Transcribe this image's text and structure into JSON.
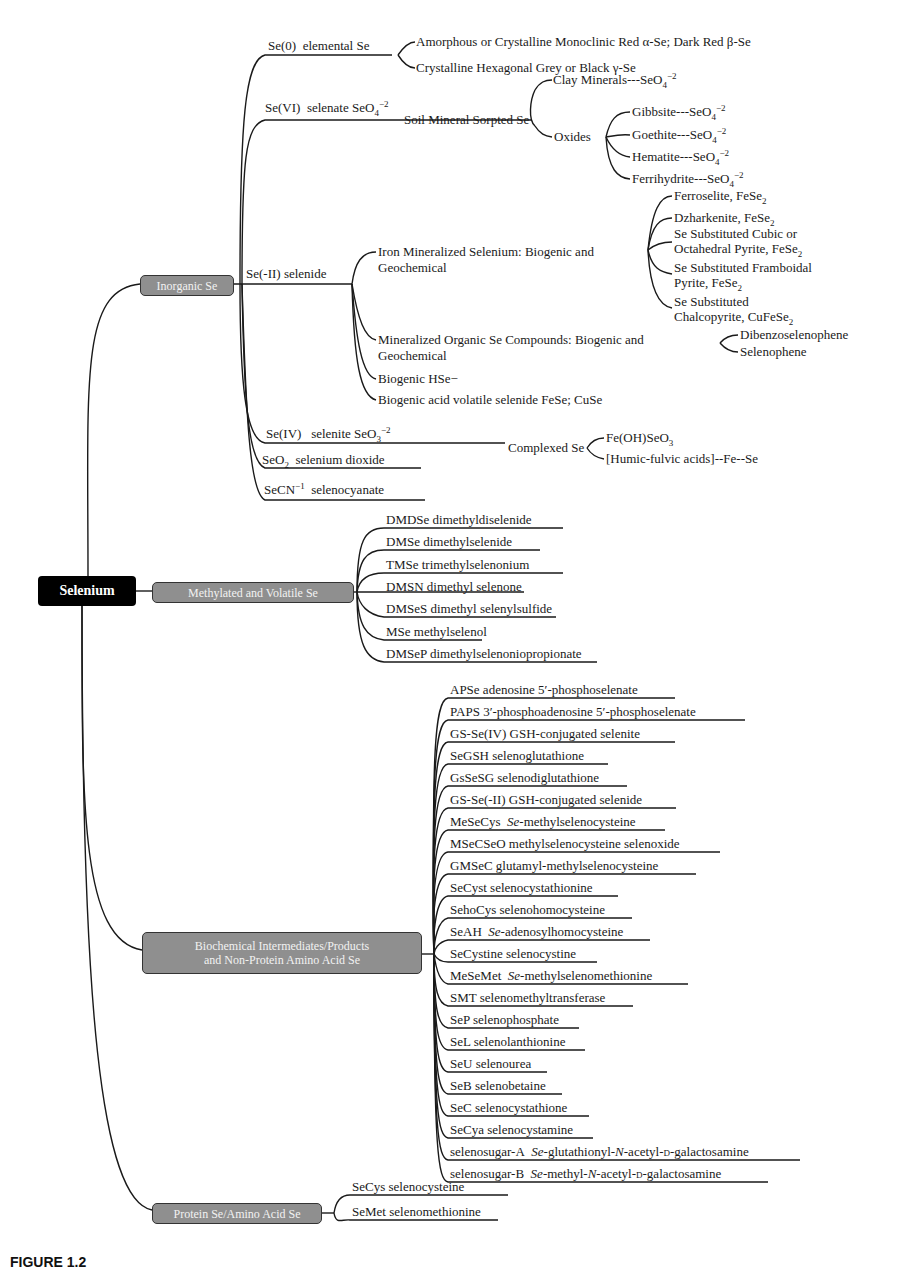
{
  "root": {
    "label": "Selenium"
  },
  "categories": {
    "inorganic": "Inorganic Se",
    "methylated": "Methylated and Volatile Se",
    "biochemical_line1": "Biochemical Intermediates/Products",
    "biochemical_line2": "and Non-Protein Amino Acid Se",
    "protein": "Protein Se/Amino Acid Se"
  },
  "inorganic": {
    "se0": {
      "label": "Se(0)  elemental Se",
      "children": [
        "Amorphous or Crystalline Monoclinic Red α-Se; Dark Red β-Se",
        "Crystalline Hexagonal Grey or Black γ-Se"
      ]
    },
    "se6": {
      "label": "Se(VI)  selenate SeO4−2",
      "sorbed": "Soil Mineral Sorpted Se",
      "clay": "Clay Minerals---SeO4−2",
      "oxides": "Oxides",
      "oxide_children": [
        "Gibbsite---SeO4−2",
        "Goethite---SeO4−2",
        "Hematite---SeO4−2",
        "Ferrihydrite---SeO4−2"
      ]
    },
    "se_minus2": {
      "label": "Se(-II)  selenide",
      "iron_line1": "Iron Mineralized Selenium: Biogenic and",
      "iron_line2": "Geochemical",
      "iron_children": [
        "Ferroselite, FeSe2",
        "Dzharkenite, FeSe2",
        "Se Substituted Cubic or | Octahedral Pyrite, FeSe2",
        "Se Substituted Framboidal | Pyrite, FeSe2",
        "Se Substituted | Chalcopyrite, CuFeSe2"
      ],
      "organic_line1": "Mineralized Organic Se Compounds: Biogenic and",
      "organic_line2": "Geochemical",
      "organic_children": [
        "Dibenzoselenophene",
        "Selenophene"
      ],
      "hse": "Biogenic HSe−",
      "avs": "Biogenic acid volatile selenide FeSe; CuSe"
    },
    "se4": {
      "label": "Se(IV)  selenite SeO3−2",
      "complexed": "Complexed Se",
      "complexed_children": [
        "Fe(OH)SeO3",
        "[Humic-fulvic acids]--Fe--Se"
      ]
    },
    "seo2": "SeO2  selenium dioxide",
    "secn": "SeCN−1  selenocyanate"
  },
  "methylated_items": [
    "DMDSe  dimethyldiselenide",
    "DMSe  dimethylselenide",
    "TMSe  trimethylselenonium",
    "DMSN  dimethyl selenone",
    "DMSeS  dimethyl selenylsulfide",
    "MSe  methylselenol",
    "DMSeP  dimethylselenoniopropionate"
  ],
  "biochemical_items": [
    "APSe  adenosine 5′-phosphoselenate",
    "PAPS  3′-phosphoadenosine 5′-phosphoselenate",
    "GS-Se(IV)  GSH-conjugated selenite",
    "SeGSH  selenoglutathione",
    "GsSeSG  selenodiglutathione",
    "GS-Se(-II)  GSH-conjugated selenide",
    "MeSeCys  Se-methylselenocysteine",
    "MSeCSeO  methylselenocysteine selenoxide",
    "GMSeC  glutamyl-methylselenocysteine",
    "SeCyst  selenocystathionine",
    "SehoCys  selenohomocysteine",
    "SeAH  Se-adenosylhomocysteine",
    "SeCystine  selenocystine",
    "MeSeMet  Se-methylselenomethionine",
    "SMT  selenomethyltransferase",
    "SeP  selenophosphate",
    "SeL  selenolanthionine",
    "SeU  selenourea",
    "SeB  selenobetaine",
    "SeC  selenocystathione",
    "SeCya  selenocystamine",
    "selenosugar-A  Se-glutathionyl-N-acetyl-D-galactosamine",
    "selenosugar-B  Se-methyl-N-acetyl-D-galactosamine"
  ],
  "protein_items": [
    "SeCys  selenocysteine",
    "SeMet  selenomethionine"
  ],
  "caption": "FIGURE 1.2"
}
